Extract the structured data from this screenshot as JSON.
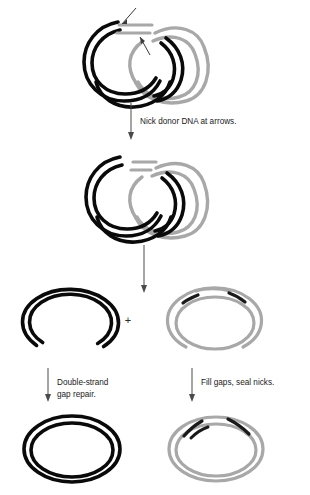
{
  "figure": {
    "colors": {
      "recipient_strand": "#0a0a0a",
      "donor_strand": "#a8a8a8",
      "donor_strand_dark": "#8f8f8f",
      "patch_segment": "#1a1a1a",
      "arrow": "#4a4a4a",
      "text": "#1a1a1a",
      "background": "#ffffff"
    }
  },
  "stages": {
    "joint_molecule": {
      "name": "joint-molecule",
      "label": "",
      "arrows": [
        {
          "name": "nick-arrow-left",
          "label": ""
        },
        {
          "name": "nick-arrow-right",
          "label": ""
        }
      ]
    },
    "nicked_intermediate": {
      "name": "nicked-intermediate",
      "label": ""
    },
    "resolved_recipient": {
      "name": "recipient-gapped-circle",
      "label": ""
    },
    "resolved_donor": {
      "name": "donor-patched-circle",
      "label": ""
    },
    "final_recipient": {
      "name": "recipient-repaired-circle",
      "label": ""
    },
    "final_donor": {
      "name": "donor-sealed-circle",
      "label": ""
    }
  },
  "steps": {
    "step1_caption": "Nick donor DNA at arrows.",
    "step2_caption": "",
    "step3_left_caption": "Double-strand gap repair.",
    "step3_left_caption_line1": "Double-strand",
    "step3_left_caption_line2": "gap repair.",
    "step3_right_caption": "Fill gaps, seal nicks.",
    "plus_operator": "+"
  }
}
